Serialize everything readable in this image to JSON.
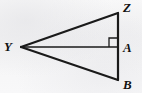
{
  "figure": {
    "kind": "geometry-diagram",
    "width": 142,
    "height": 93,
    "background_color": "#f7f7f7",
    "stroke_color": "#1a1a1a",
    "label_color": "#111111"
  },
  "points": {
    "Y": {
      "label": "Y",
      "x": 21,
      "y": 47,
      "label_x": 4,
      "label_y": 40
    },
    "Z": {
      "label": "Z",
      "x": 118,
      "y": 13,
      "label_x": 123,
      "label_y": 1
    },
    "A": {
      "label": "A",
      "x": 118,
      "y": 47,
      "label_x": 123,
      "label_y": 41
    },
    "B": {
      "label": "B",
      "x": 118,
      "y": 80,
      "label_x": 123,
      "label_y": 78
    }
  },
  "segments": [
    {
      "name": "YZ",
      "from": "Y",
      "to": "Z",
      "stroke_width": 2.2
    },
    {
      "name": "ZB",
      "from": "Z",
      "to": "B",
      "stroke_width": 2.2
    },
    {
      "name": "YB",
      "from": "Y",
      "to": "B",
      "stroke_width": 2.2
    },
    {
      "name": "YA",
      "from": "Y",
      "to": "A",
      "stroke_width": 1.7
    }
  ],
  "right_angle_marker": {
    "name": "right-angle-at-A",
    "at_point": "A",
    "size": 9,
    "orientation": "upper-left",
    "stroke_width": 1.3
  }
}
